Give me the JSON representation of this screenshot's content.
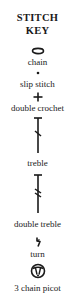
{
  "title": {
    "line1": "STITCH",
    "line2": "KEY"
  },
  "stitches": [
    {
      "label": "chain",
      "icon": "chain-oval-icon"
    },
    {
      "label": "slip stitch",
      "icon": "dot-icon"
    },
    {
      "label": "double crochet",
      "icon": "plus-icon"
    },
    {
      "label": "treble",
      "icon": "treble-icon"
    },
    {
      "label": "double treble",
      "icon": "double-treble-icon"
    },
    {
      "label": "turn",
      "icon": "turn-icon"
    },
    {
      "label": "3 chain picot",
      "icon": "picot-icon"
    }
  ],
  "colors": {
    "background": "#ffffff",
    "ink": "#1a1a1a"
  }
}
